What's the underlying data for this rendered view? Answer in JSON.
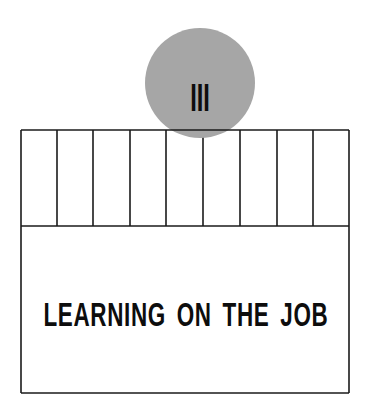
{
  "part": {
    "numeral": "III"
  },
  "title": "LEARNING ON THE JOB",
  "colors": {
    "circle": "#a6a6a6",
    "line": "#1a1a1a",
    "text": "#0d0d0d",
    "background": "#ffffff"
  },
  "layout": {
    "box": {
      "x": 21,
      "y": 130,
      "width": 328,
      "height": 263
    },
    "divider_y": 226,
    "vertical_lines_x": [
      57,
      93,
      130,
      166,
      203,
      240,
      277,
      313
    ],
    "circle": {
      "cx": 200,
      "cy": 83,
      "r": 55
    }
  }
}
